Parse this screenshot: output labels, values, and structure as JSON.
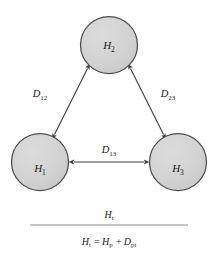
{
  "figure": {
    "background_color": "#ffffff",
    "node_fill_color": "#d2d2d2",
    "node_stroke_color": "#4d4d4d",
    "arrow_color": "#3c3c3c",
    "text_color": "#1a1a1a",
    "rule_color": "#8c8c8c"
  },
  "nodes": [
    {
      "id": "node-h2",
      "base": "H",
      "subscript": "2",
      "label": "H2",
      "cx": 109,
      "cy": 45,
      "r": 29
    },
    {
      "id": "node-h1",
      "base": "H",
      "subscript": "1",
      "label": "H1",
      "cx": 40,
      "cy": 162,
      "r": 29
    },
    {
      "id": "node-h3",
      "base": "H",
      "subscript": "3",
      "label": "H3",
      "cx": 178,
      "cy": 162,
      "r": 29
    }
  ],
  "edges": [
    {
      "id": "edge-d12",
      "base": "D",
      "subscript": "12",
      "label": "D12",
      "from": "node-h1",
      "to": "node-h2",
      "label_x": 40,
      "label_y": 97,
      "arrow_style": "double-headed"
    },
    {
      "id": "edge-d23",
      "base": "D",
      "subscript": "23",
      "label": "D23",
      "from": "node-h2",
      "to": "node-h3",
      "label_x": 168,
      "label_y": 97,
      "arrow_style": "double-headed"
    },
    {
      "id": "edge-d13",
      "base": "D",
      "subscript": "13",
      "label": "D13",
      "from": "node-h1",
      "to": "node-h3",
      "label_x": 109,
      "label_y": 153,
      "arrow_style": "double-headed"
    }
  ],
  "formula": {
    "numerator": {
      "base": "H",
      "subscript": "t",
      "label": "Ht"
    },
    "denominator": {
      "label": "Ht = Hp + Dpt",
      "terms": [
        {
          "base": "H",
          "subscript": "t"
        },
        {
          "operator": "="
        },
        {
          "base": "H",
          "subscript": "p"
        },
        {
          "operator": "+"
        },
        {
          "base": "D",
          "subscript": "pt"
        }
      ]
    },
    "rule": {
      "x1": 30,
      "x2": 188,
      "y": 225
    }
  }
}
